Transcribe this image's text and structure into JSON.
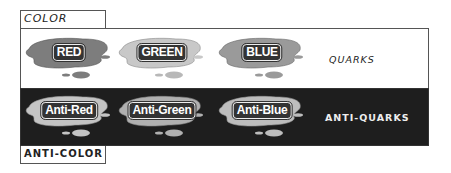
{
  "tabs": {
    "color": "COLOR",
    "anti_color": "ANTI-COLOR"
  },
  "rows": {
    "quarks": {
      "label": "QUARKS",
      "background": "#ffffff",
      "blobs": [
        {
          "label": "RED",
          "fill": "#7d7d7d"
        },
        {
          "label": "GREEN",
          "fill": "#c8c8c8"
        },
        {
          "label": "BLUE",
          "fill": "#9a9a9a"
        }
      ]
    },
    "anti_quarks": {
      "label": "ANTI-QUARKS",
      "background": "#1e1e1e",
      "blobs": [
        {
          "label": "Anti-Red",
          "fill": "#c4c4c4"
        },
        {
          "label": "Anti-Green",
          "fill": "#b0b0b0"
        },
        {
          "label": "Anti-Blue",
          "fill": "#bdbdbd"
        }
      ]
    }
  }
}
